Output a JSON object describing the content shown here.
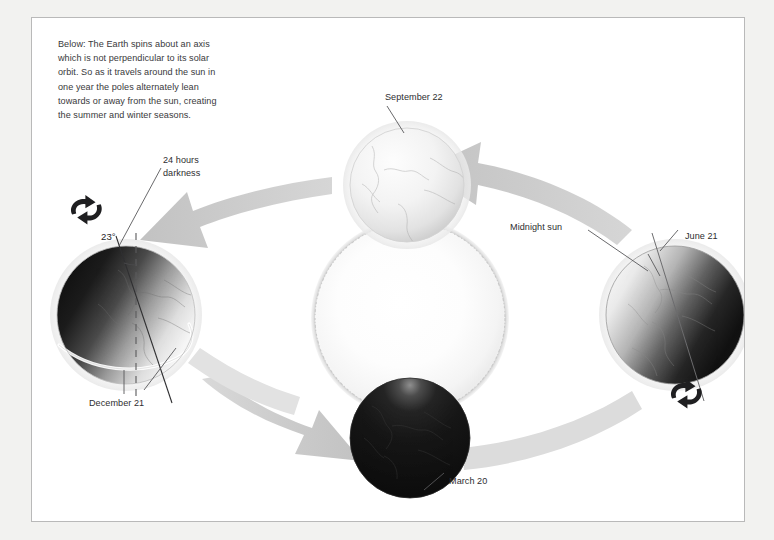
{
  "page": {
    "background_color": "#f2f2f0",
    "panel_background": "#ffffff",
    "panel_border_color": "#b9b9b9"
  },
  "caption": {
    "text": "Below:  The Earth spins about an axis\nwhich is not perpendicular to its solar\norbit. So as it travels around the sun in\none year the poles alternately lean\ntowards or away from the sun, creating\nthe summer and winter seasons."
  },
  "diagram": {
    "title_subject": "Earth's seasons and axial tilt",
    "sun": {
      "label": "Sun",
      "color": "#fcfcfc",
      "corona_color": "#c9c9c9"
    },
    "orbit_direction": "counterclockwise",
    "arrow_color": "#c6c6c6",
    "globes": [
      {
        "id": "september",
        "label": "September 22",
        "season": "equinox",
        "lit_side": "front",
        "appearance": "fully lit"
      },
      {
        "id": "december",
        "label": "December 21",
        "season": "northern winter solstice",
        "lit_side": "right",
        "appearance": "night side toward viewer-left"
      },
      {
        "id": "march",
        "label": "March 20",
        "season": "equinox",
        "lit_side": "back",
        "appearance": "dark, facing away from sun"
      },
      {
        "id": "june",
        "label": "June 21",
        "season": "northern summer solstice",
        "lit_side": "left",
        "appearance": "night side toward viewer-right"
      }
    ],
    "annotations": [
      {
        "id": "tilt",
        "text": "23°",
        "target": "december globe axis"
      },
      {
        "id": "darkness",
        "text": "24 hours\ndarkness",
        "target": "december globe north pole"
      },
      {
        "id": "midnight-sun",
        "text": "Midnight sun",
        "target": "june globe north pole"
      }
    ],
    "icons": [
      {
        "id": "spin-left",
        "name": "rotation-arrow-icon",
        "target": "december globe"
      },
      {
        "id": "spin-right",
        "name": "rotation-arrow-icon",
        "target": "june globe"
      }
    ],
    "colors": {
      "text": "#2e2e30",
      "caption_text": "#39393b",
      "globe_dark": "#121212",
      "globe_light": "#f4f4f4",
      "leader_line": "#4a4a4c"
    }
  }
}
